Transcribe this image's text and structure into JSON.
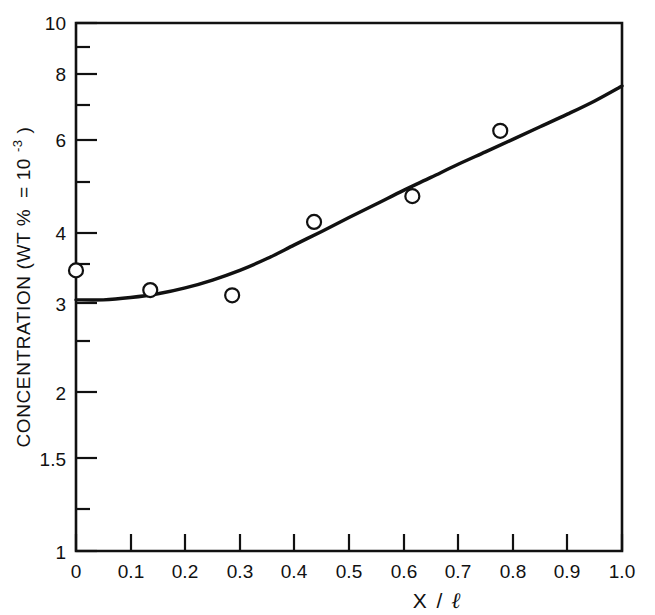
{
  "figure": {
    "title": "",
    "background_color": "#ffffff",
    "line_color": "#111111",
    "marker_face_color": "#ffffff"
  },
  "axes": {
    "y": {
      "label_main": "CONCENTRATION (WT %",
      "label_equals": "= 10",
      "label_exponent": "-3",
      "label_close": ")",
      "label_full": "CONCENTRATION (WT % = 10-3)",
      "scale": "log",
      "min": 1,
      "max": 10,
      "tick_labels": [
        "10",
        "8",
        "6",
        "4",
        "3",
        "2",
        "1.5",
        "1"
      ],
      "tick_values": [
        10,
        8,
        6,
        4,
        3,
        2,
        1.5,
        1
      ],
      "minor_tick_values": [
        9,
        7,
        5,
        3.5,
        2.5,
        1.2
      ]
    },
    "x": {
      "label_numerator": "X",
      "label_slash": "/",
      "label_denominator": "ℓ",
      "label_full": "X/ℓ",
      "scale": "linear",
      "min": 0,
      "max": 1.0,
      "tick_labels": [
        "0",
        "0.1",
        "0.2",
        "0.3",
        "0.4",
        "0.5",
        "0.6",
        "0.7",
        "0.8",
        "0.9",
        "1.0"
      ],
      "tick_values": [
        0,
        0.1,
        0.2,
        0.3,
        0.4,
        0.5,
        0.6,
        0.7,
        0.8,
        0.9,
        1.0
      ]
    }
  },
  "chart_data": {
    "type": "scatter",
    "title": "",
    "xlabel": "X/ℓ",
    "ylabel": "CONCENTRATION (WT % = 10-3)",
    "xlim": [
      0,
      1.0
    ],
    "ylim": [
      1,
      10
    ],
    "yscale": "log",
    "xscale": "linear",
    "grid": false,
    "legend": "none",
    "series": [
      {
        "name": "measured concentration",
        "type": "scatter",
        "marker": "open-circle",
        "x": [
          0.0,
          0.136,
          0.286,
          0.436,
          0.616,
          0.777
        ],
        "y": [
          3.4,
          3.12,
          3.05,
          4.2,
          4.7,
          6.25
        ]
      },
      {
        "name": "fitted curve",
        "type": "line",
        "x": [
          0.0,
          0.05,
          0.1,
          0.15,
          0.2,
          0.25,
          0.3,
          0.35,
          0.4,
          0.45,
          0.5,
          0.55,
          0.6,
          0.65,
          0.7,
          0.75,
          0.8,
          0.85,
          0.9,
          0.95,
          1.0
        ],
        "y": [
          2.99,
          2.99,
          3.02,
          3.07,
          3.15,
          3.26,
          3.4,
          3.58,
          3.8,
          4.03,
          4.28,
          4.54,
          4.82,
          5.1,
          5.4,
          5.7,
          6.02,
          6.36,
          6.72,
          7.12,
          7.6
        ]
      }
    ]
  }
}
